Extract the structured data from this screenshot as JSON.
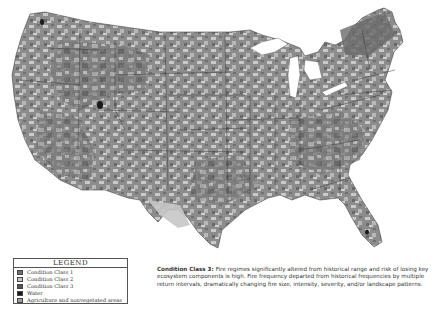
{
  "map": {
    "subject": "Fire Regime Condition Classes - Conterminous United States",
    "colors": {
      "condition_class_1": "#7a7a7a",
      "condition_class_2": "#c4c4c4",
      "condition_class_3": "#5a5a5a",
      "water": "#1e1e1e",
      "agriculture": "#a8a8a8"
    }
  },
  "legend": {
    "title": "LEGEND",
    "items": [
      {
        "label": "Condition Class 1",
        "color": "#6e6e6e"
      },
      {
        "label": "Condition Class 2",
        "color": "#c8c8c8"
      },
      {
        "label": "Condition Class 3",
        "color": "#555555"
      },
      {
        "label": "Water",
        "color": "#1a1a1a"
      },
      {
        "label": "Agriculture and nonvegetated areas",
        "color": "#a0a0a0"
      }
    ]
  },
  "caption": {
    "heading": "Condition Class 3:",
    "text": "Fire regimes significantly altered from historical range and risk of losing key ecosystem components is high. Fire frequency departed from historical frequencies by multiple return intervals, dramatically changing fire size, intensity, severity, and/or landscape patterns."
  }
}
